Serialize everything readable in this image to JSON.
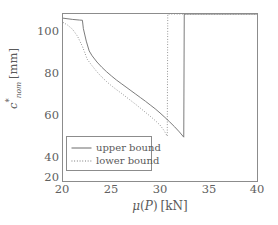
{
  "chart_data": {
    "type": "line",
    "title": "",
    "xlabel": "μ(P) [kN]",
    "ylabel": "c*_nom [mm]",
    "xlim": [
      20,
      40
    ],
    "ylim": [
      20,
      100
    ],
    "xticks": [
      20,
      25,
      30,
      35,
      40
    ],
    "yticks": [
      20,
      40,
      60,
      80,
      100
    ],
    "xtick_labels": [
      "20",
      "25",
      "30",
      "35",
      "40"
    ],
    "ytick_labels": [
      "20",
      "40",
      "60",
      "80",
      "100"
    ],
    "grid": false,
    "legend_position": "lower-left",
    "annotations": [],
    "series": [
      {
        "name": "upper bound",
        "style": "solid",
        "color": "#6b6b6b",
        "x": [
          20.0,
          21.0,
          21.7,
          22.0,
          22.1,
          22.4,
          22.7,
          23.0,
          23.5,
          24.0,
          24.5,
          25.0,
          25.5,
          26.0,
          26.5,
          27.0,
          27.5,
          28.0,
          28.5,
          29.0,
          29.5,
          30.0,
          30.5,
          31.0,
          31.5,
          32.0,
          32.45,
          32.5,
          33.0,
          34.0,
          36.0,
          38.0,
          40.0
        ],
        "y": [
          98.0,
          97.4,
          97.1,
          97.0,
          93.0,
          87.0,
          82.3,
          80.0,
          77.0,
          74.5,
          72.3,
          70.3,
          68.4,
          66.7,
          65.0,
          63.3,
          61.6,
          59.9,
          58.2,
          56.4,
          54.6,
          52.6,
          50.5,
          48.3,
          46.0,
          43.5,
          41.0,
          100.0,
          100.0,
          100.0,
          100.0,
          100.0,
          100.0
        ]
      },
      {
        "name": "lower bound",
        "style": "dotted",
        "color": "#6b6b6b",
        "x": [
          20.0,
          20.5,
          21.0,
          21.5,
          22.0,
          22.3,
          22.5,
          23.0,
          23.5,
          24.0,
          24.5,
          25.0,
          25.5,
          26.0,
          26.5,
          27.0,
          27.5,
          28.0,
          28.5,
          29.0,
          29.5,
          30.0,
          30.4,
          30.75,
          30.8,
          31.0,
          32.0,
          34.0,
          36.0,
          38.0,
          40.0
        ],
        "y": [
          96.0,
          94.6,
          92.6,
          89.3,
          84.5,
          80.8,
          78.3,
          75.2,
          72.3,
          69.8,
          67.6,
          65.6,
          63.8,
          62.1,
          60.3,
          58.5,
          56.7,
          54.8,
          52.9,
          51.0,
          49.0,
          46.8,
          44.3,
          41.5,
          100.0,
          100.0,
          100.0,
          100.0,
          100.0,
          100.0,
          100.0
        ]
      }
    ]
  },
  "axes": {
    "y_title_prefix": "c",
    "y_title_star": "*",
    "y_title_sub": "nom",
    "y_title_unit": "[mm]",
    "x_title_mu": "μ",
    "x_title_open": "(",
    "x_title_var": "P",
    "x_title_close": ")",
    "x_title_unit": "[kN]"
  },
  "legend": {
    "entries": [
      {
        "label": "upper bound",
        "style": "solid"
      },
      {
        "label": "lower bound",
        "style": "dotted"
      }
    ]
  }
}
